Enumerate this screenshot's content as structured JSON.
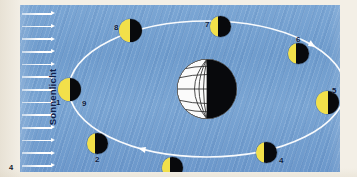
{
  "figure": {
    "number": "4",
    "background_color": "#f3efe6",
    "panel_color": "#6f9ccd"
  },
  "sunlight": {
    "label": "Sonnenlicht",
    "direction": "left-to-right",
    "ray_count": 13,
    "ray_color": "#ffffff",
    "label_color": "#10204a"
  },
  "earth": {
    "name": "Erde",
    "lit_side": "left",
    "lit_color": "#ffffff",
    "dark_color": "#08090c",
    "cx": 187,
    "cy": 84,
    "r": 31
  },
  "orbit": {
    "name": "Mondbahn",
    "color": "#ffffff",
    "cx": 187,
    "cy": 84,
    "rx": 138,
    "ry": 68,
    "direction_arrows": 2
  },
  "moons": [
    {
      "label": "1",
      "secondary_label": "9",
      "x": 49,
      "y": 84,
      "r": 11.5,
      "lit": "left",
      "phase": "Neumond",
      "label_dx": -13,
      "label_dy": 10,
      "secondary_dx": 13,
      "secondary_dy": 11
    },
    {
      "label": "2",
      "secondary_label": "",
      "x": 77,
      "y": 138,
      "r": 10.5,
      "lit": "left",
      "phase": "zunehmende Sichel",
      "label_dx": -2,
      "label_dy": 13,
      "secondary_dx": 0,
      "secondary_dy": 0
    },
    {
      "label": "3",
      "secondary_label": "",
      "x": 152,
      "y": 162,
      "r": 10.5,
      "lit": "left",
      "phase": "erstes Viertel",
      "label_dx": 13,
      "label_dy": 7,
      "secondary_dx": 0,
      "secondary_dy": 0
    },
    {
      "label": "4",
      "secondary_label": "",
      "x": 246,
      "y": 147,
      "r": 10.5,
      "lit": "left",
      "phase": "zunehmender Mond",
      "label_dx": 13,
      "label_dy": 5,
      "secondary_dx": 0,
      "secondary_dy": 0
    },
    {
      "label": "5",
      "secondary_label": "",
      "x": 307,
      "y": 97,
      "r": 11.5,
      "lit": "left",
      "phase": "Vollmond",
      "label_dx": 5,
      "label_dy": -15,
      "secondary_dx": 0,
      "secondary_dy": 0
    },
    {
      "label": "6",
      "secondary_label": "",
      "x": 278,
      "y": 48,
      "r": 10.5,
      "lit": "left",
      "phase": "abnehmender Mond",
      "label_dx": -2,
      "label_dy": -17,
      "secondary_dx": 0,
      "secondary_dy": 0
    },
    {
      "label": "7",
      "secondary_label": "",
      "x": 200,
      "y": 21,
      "r": 10.5,
      "lit": "left",
      "phase": "letztes Viertel",
      "label_dx": -15,
      "label_dy": -5,
      "secondary_dx": 0,
      "secondary_dy": 0
    },
    {
      "label": "8",
      "secondary_label": "",
      "x": 110,
      "y": 25,
      "r": 11.5,
      "lit": "left",
      "phase": "abnehmende Sichel",
      "label_dx": -16,
      "label_dy": -6,
      "secondary_dx": 0,
      "secondary_dy": 0
    }
  ]
}
